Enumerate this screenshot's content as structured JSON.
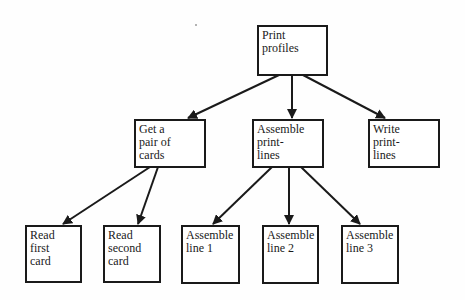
{
  "diagram": {
    "type": "hierarchy-chart",
    "nodes": [
      {
        "id": "print-profiles",
        "lines": [
          "Print",
          "profiles"
        ]
      },
      {
        "id": "get-pair",
        "lines": [
          "Get a",
          "pair of",
          "cards"
        ]
      },
      {
        "id": "assemble-print-lines",
        "lines": [
          "Assemble",
          "print-",
          "lines"
        ]
      },
      {
        "id": "write-print-lines",
        "lines": [
          "Write",
          "print-",
          "lines"
        ]
      },
      {
        "id": "read-first",
        "lines": [
          "Read",
          "first",
          "card"
        ]
      },
      {
        "id": "read-second",
        "lines": [
          "Read",
          "second",
          "card"
        ]
      },
      {
        "id": "assemble-line-1",
        "lines": [
          "Assemble",
          "line 1"
        ]
      },
      {
        "id": "assemble-line-2",
        "lines": [
          "Assemble",
          "line 2"
        ]
      },
      {
        "id": "assemble-line-3",
        "lines": [
          "Assemble",
          "line 3"
        ]
      }
    ],
    "edges": [
      {
        "from": "print-profiles",
        "to": "get-pair"
      },
      {
        "from": "print-profiles",
        "to": "assemble-print-lines"
      },
      {
        "from": "print-profiles",
        "to": "write-print-lines"
      },
      {
        "from": "get-pair",
        "to": "read-first"
      },
      {
        "from": "get-pair",
        "to": "read-second"
      },
      {
        "from": "assemble-print-lines",
        "to": "assemble-line-1"
      },
      {
        "from": "assemble-print-lines",
        "to": "assemble-line-2"
      },
      {
        "from": "assemble-print-lines",
        "to": "assemble-line-3"
      }
    ]
  }
}
